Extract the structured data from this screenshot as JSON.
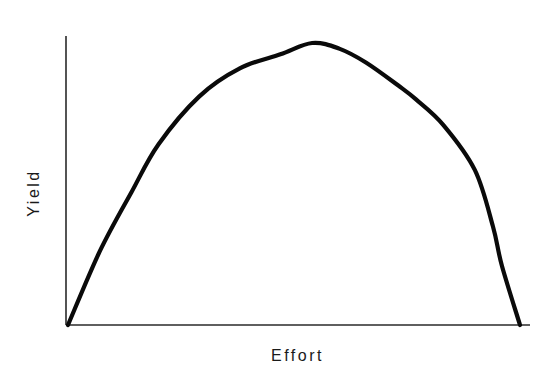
{
  "chart_data": {
    "type": "line",
    "title": "",
    "xlabel": "Effort",
    "ylabel": "Yield",
    "grid": false,
    "legend": null,
    "axis_ticks": false,
    "xlim": [
      0,
      100
    ],
    "ylim": [
      0,
      100
    ],
    "series": [
      {
        "name": "Yield vs Effort",
        "x": [
          0,
          7,
          14,
          20,
          29,
          38,
          47,
          54,
          60,
          66,
          73,
          77,
          83,
          90,
          94,
          96,
          100
        ],
        "values": [
          0,
          26,
          47,
          64,
          81,
          91,
          96,
          100,
          98,
          93,
          85,
          80,
          71,
          55,
          35,
          21,
          0
        ]
      }
    ],
    "annotations": []
  },
  "layout": {
    "plot": {
      "x0": 66,
      "y0": 325,
      "x1": 530,
      "y1": 36
    },
    "curve_px": [
      [
        68,
        325
      ],
      [
        100,
        250
      ],
      [
        133,
        190
      ],
      [
        160,
        140
      ],
      [
        200,
        92
      ],
      [
        240,
        62
      ],
      [
        280,
        48
      ],
      [
        315,
        43
      ],
      [
        340,
        48
      ],
      [
        370,
        62
      ],
      [
        400,
        85
      ],
      [
        420,
        100
      ],
      [
        445,
        125
      ],
      [
        475,
        170
      ],
      [
        493,
        226
      ],
      [
        505,
        265
      ],
      [
        520,
        325
      ]
    ],
    "colors": {
      "curve": "#0a0a0a",
      "axis": "#2a2a2a",
      "background": "#ffffff"
    }
  },
  "labels": {
    "x_axis": "Effort",
    "y_axis": "Yield"
  }
}
